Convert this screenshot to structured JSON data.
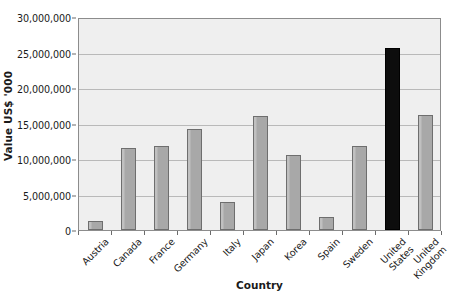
{
  "chart_data": {
    "type": "bar",
    "title": "",
    "xlabel": "Country",
    "ylabel": "Value US$ '000",
    "categories": [
      "Austria",
      "Canada",
      "France",
      "Germany",
      "Italy",
      "Japan",
      "Korea",
      "Spain",
      "Sweden",
      "United States",
      "United Kingdom"
    ],
    "category_lines": [
      [
        "Austria"
      ],
      [
        "Canada"
      ],
      [
        "France"
      ],
      [
        "Germany"
      ],
      [
        "Italy"
      ],
      [
        "Japan"
      ],
      [
        "Korea"
      ],
      [
        "Spain"
      ],
      [
        "Sweden"
      ],
      [
        "United",
        "States"
      ],
      [
        "United",
        "Kingdom"
      ]
    ],
    "values": [
      1200000,
      11600000,
      11900000,
      14200000,
      3900000,
      16100000,
      10600000,
      1800000,
      11900000,
      25600000,
      16200000
    ],
    "highlight_index": 9,
    "ylim": [
      0,
      30000000
    ],
    "y_ticks": [
      0,
      5000000,
      10000000,
      15000000,
      20000000,
      25000000,
      30000000
    ],
    "y_tick_labels": [
      "0",
      "5,000,000",
      "10,000,000",
      "15,000,000",
      "20,000,000",
      "25,000,000",
      "30,000,000"
    ],
    "grid": true,
    "legend": false,
    "colors": {
      "bar_fill": "#a8a8a8",
      "bar_edge": "#6e6e6e",
      "highlight_fill": "#0d0d0d",
      "plot_background": "#efefef",
      "gridline": "#b9b9b9",
      "axis": "#8c8c8c",
      "text": "#1a1a1a"
    }
  }
}
